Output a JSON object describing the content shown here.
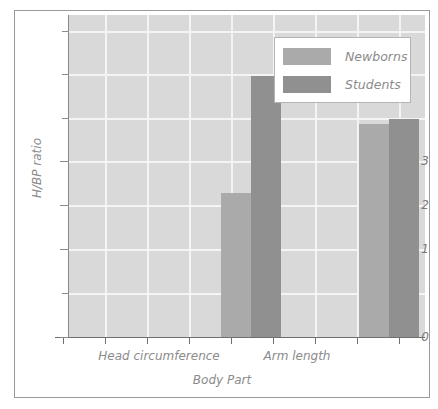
{
  "chart_data": {
    "type": "bar",
    "title": "",
    "xlabel": "Body Part",
    "ylabel": "H/BP ratio",
    "categories": [
      "Head circumference",
      "Arm length"
    ],
    "series": [
      {
        "name": "Newborns",
        "values": [
          1.65,
          2.45
        ],
        "color": "#aaaaaa"
      },
      {
        "name": "Students",
        "values": [
          3.0,
          2.5
        ],
        "color": "#909090"
      }
    ],
    "ylim": [
      0,
      3.7
    ],
    "ytick_labels": [
      "0",
      "1",
      "2",
      "3"
    ],
    "ytick_values": [
      0,
      1,
      2,
      3
    ],
    "yminor_values": [
      0.5,
      1.5,
      2.5,
      3.5
    ],
    "grid": true,
    "grid_color": "#f4f4f4",
    "plot_background": "#d9d9d9",
    "legend_position": "top-right"
  },
  "legend": {
    "items": [
      {
        "label": "Newborns"
      },
      {
        "label": "Students"
      }
    ]
  },
  "axes": {
    "y_title": "H/BP ratio",
    "x_title": "Body Part",
    "y_labels": [
      "3",
      "2",
      "1",
      "0"
    ],
    "x_labels": [
      "Head circumference",
      "Arm length"
    ]
  }
}
